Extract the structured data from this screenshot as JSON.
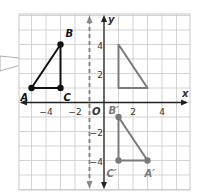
{
  "diagram": {
    "type": "coordinate-plane-reflection",
    "axes": {
      "x_label": "x",
      "y_label": "y",
      "origin_label": "O",
      "x_ticks": [
        {
          "value": -4,
          "label": "−4"
        },
        {
          "value": -2,
          "label": "−2"
        },
        {
          "value": 2,
          "label": "2"
        },
        {
          "value": 4,
          "label": "4"
        }
      ],
      "y_ticks": [
        {
          "value": 4,
          "label": "4"
        },
        {
          "value": 2,
          "label": "2"
        },
        {
          "value": -2,
          "label": "−2"
        },
        {
          "value": -4,
          "label": "−4"
        }
      ],
      "x_range": [
        -6,
        6
      ],
      "y_range": [
        -6,
        6
      ]
    },
    "reflection_line": {
      "x": -1,
      "style": "dashed"
    },
    "original_triangle": {
      "color": "#111111",
      "points": [
        {
          "name": "A",
          "label": "A",
          "x": -5,
          "y": 1
        },
        {
          "name": "B",
          "label": "B",
          "x": -3,
          "y": 4
        },
        {
          "name": "C",
          "label": "C",
          "x": -3,
          "y": 1
        }
      ]
    },
    "intermediate_triangle": {
      "color": "#7a7a7a",
      "points": [
        {
          "x": 1,
          "y": 4
        },
        {
          "x": 1,
          "y": 1
        },
        {
          "x": 3,
          "y": 1
        }
      ]
    },
    "image_triangle": {
      "color": "#7a7a7a",
      "points": [
        {
          "name": "B'",
          "label": "B′",
          "x": 1,
          "y": -1
        },
        {
          "name": "C'",
          "label": "C′",
          "x": 1,
          "y": -4
        },
        {
          "name": "A'",
          "label": "A′",
          "x": 3,
          "y": -4
        }
      ]
    },
    "callout": {
      "from_edge": "left",
      "points_to": "triangle-ABC"
    },
    "colors": {
      "grid": "#c8c8c8",
      "axis": "#222222",
      "dashed_line": "#888888",
      "original": "#111111",
      "image": "#7a7a7a"
    }
  }
}
